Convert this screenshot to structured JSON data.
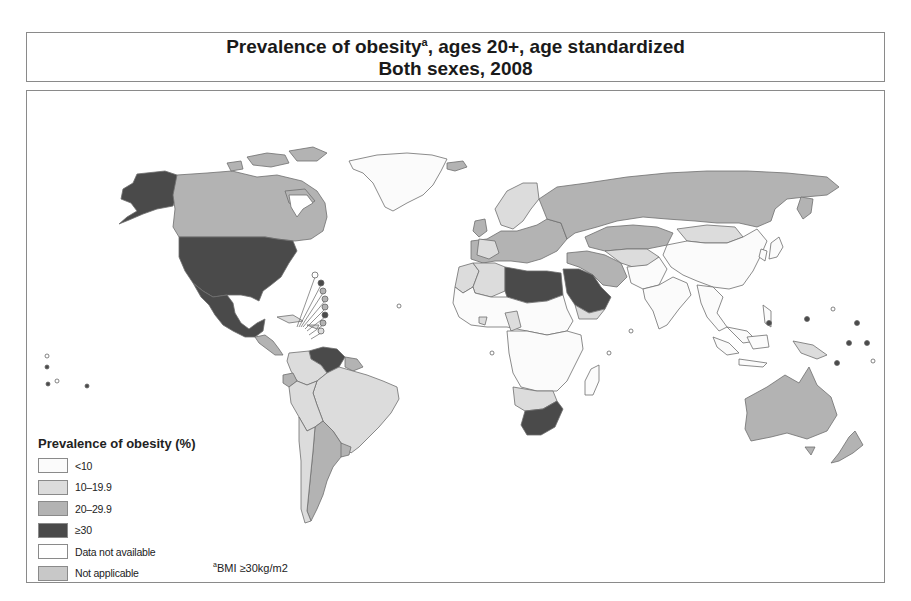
{
  "title": {
    "line1_text": "Prevalence of obesity",
    "line1_superscript": "a",
    "line1_suffix": ", ages 20+, age standardized",
    "line2": "Both sexes, 2008"
  },
  "legend": {
    "title": "Prevalence of obesity (%)",
    "items": [
      {
        "label": "<10",
        "color": "#fbfbfb"
      },
      {
        "label": "10–19.9",
        "color": "#dcdcdc"
      },
      {
        "label": "20–29.9",
        "color": "#b3b3b3"
      },
      {
        "label": "≥30",
        "color": "#4a4a4a"
      },
      {
        "label": "Data not available",
        "color": "#ffffff"
      },
      {
        "label": "Not applicable",
        "color": "#c8c8c8"
      }
    ]
  },
  "footnote": {
    "superscript": "a",
    "text": "BMI ≥30kg/m2"
  },
  "map_regions": [
    {
      "name": "Alaska",
      "category": "≥30"
    },
    {
      "name": "Canada",
      "category": "20–29.9"
    },
    {
      "name": "Greenland",
      "category": "<10"
    },
    {
      "name": "United States",
      "category": "≥30"
    },
    {
      "name": "Mexico",
      "category": "≥30"
    },
    {
      "name": "Central America",
      "category": "20–29.9"
    },
    {
      "name": "Venezuela",
      "category": "≥30"
    },
    {
      "name": "Brazil",
      "category": "10–19.9"
    },
    {
      "name": "Andean South America",
      "category": "10–19.9"
    },
    {
      "name": "Argentina",
      "category": "20–29.9"
    },
    {
      "name": "Europe",
      "category": "20–29.9"
    },
    {
      "name": "Russia",
      "category": "20–29.9"
    },
    {
      "name": "Kazakhstan",
      "category": "20–29.9"
    },
    {
      "name": "Mongolia",
      "category": "10–19.9"
    },
    {
      "name": "China",
      "category": "<10"
    },
    {
      "name": "India",
      "category": "<10"
    },
    {
      "name": "Southeast Asia",
      "category": "<10"
    },
    {
      "name": "North Africa",
      "category": "≥30"
    },
    {
      "name": "Arabian Peninsula",
      "category": "≥30"
    },
    {
      "name": "Iran / Turkey",
      "category": "20–29.9"
    },
    {
      "name": "West Africa",
      "category": "10–19.9"
    },
    {
      "name": "Sub-Saharan Africa",
      "category": "<10"
    },
    {
      "name": "Southern Africa",
      "category": "10–19.9"
    },
    {
      "name": "South Africa",
      "category": "≥30"
    },
    {
      "name": "Madagascar",
      "category": "<10"
    },
    {
      "name": "Australia",
      "category": "20–29.9"
    },
    {
      "name": "New Zealand",
      "category": "20–29.9"
    },
    {
      "name": "Papua New Guinea",
      "category": "10–19.9"
    }
  ]
}
